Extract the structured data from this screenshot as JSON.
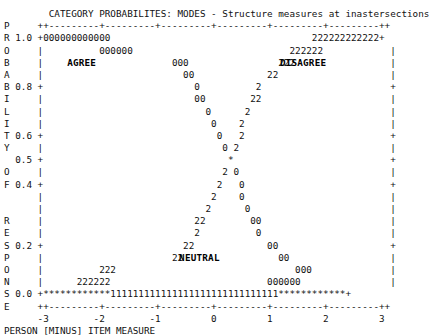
{
  "chart_data": {
    "type": "line",
    "title": "CATEGORY PROBABILITES: MODES - Structure measures at inastersections",
    "xlabel": "PERSON [MINUS] ITEM MEASURE",
    "ylabel": "PROBABILITY OF RESPONSE",
    "xlim": [
      -3,
      3
    ],
    "ylim": [
      0.0,
      1.0
    ],
    "xticklabels": [
      "-3",
      "-2",
      "-1",
      "0",
      "1",
      "2",
      "3"
    ],
    "yticklabels": [
      "1.0",
      "0.8",
      "0.6",
      "0.5",
      "0.4",
      "0.2",
      "0.0"
    ],
    "grid": false,
    "legend_position": "inline-annotations",
    "annotations": [
      {
        "text": "AGREE",
        "x": -2.35,
        "y": 0.93
      },
      {
        "text": "DISAGREE",
        "x": 2.05,
        "y": 0.93
      },
      {
        "text": "NEUTRAL",
        "x": 0.0,
        "y": 0.18
      }
    ],
    "series": [
      {
        "name": "0",
        "symbol": "0",
        "label": "AGREE",
        "x": [
          -3.0,
          -2.9,
          -2.8,
          -2.7,
          -2.6,
          -2.5,
          -2.4,
          -2.3,
          -2.2,
          -2.1,
          -2.0,
          -1.9,
          -1.75,
          -1.6,
          -1.45,
          -1.3,
          -1.15,
          -1.0,
          -0.9,
          -0.8,
          -0.7,
          -0.6,
          -0.5,
          -0.4,
          -0.3,
          -0.2,
          -0.1,
          0.0,
          0.1,
          0.2,
          0.3,
          0.45,
          0.6,
          0.8,
          1.0,
          1.3,
          1.6,
          2.0,
          2.4,
          2.8,
          3.0
        ],
        "y": [
          1.0,
          1.0,
          1.0,
          1.0,
          1.0,
          1.0,
          1.0,
          1.0,
          1.0,
          1.0,
          1.0,
          0.97,
          0.97,
          0.94,
          0.94,
          0.9,
          0.87,
          0.84,
          0.81,
          0.78,
          0.75,
          0.72,
          0.69,
          0.66,
          0.63,
          0.6,
          0.56,
          0.5,
          0.44,
          0.4,
          0.36,
          0.31,
          0.26,
          0.21,
          0.16,
          0.12,
          0.08,
          0.05,
          0.02,
          0.0,
          0.0
        ]
      },
      {
        "name": "1",
        "symbol": "1",
        "label": "NEUTRAL",
        "x": [
          -2.0,
          -1.6,
          -1.2,
          -0.8,
          -0.4,
          0.0,
          0.4,
          0.8,
          1.2,
          1.6,
          2.0
        ],
        "y": [
          0.0,
          0.0,
          0.0,
          0.0,
          0.0,
          0.0,
          0.0,
          0.0,
          0.0,
          0.0,
          0.0
        ]
      },
      {
        "name": "2",
        "symbol": "2",
        "label": "DISAGREE",
        "x": [
          -3.0,
          -2.8,
          -2.4,
          -2.0,
          -1.6,
          -1.3,
          -1.0,
          -0.8,
          -0.6,
          -0.45,
          -0.3,
          -0.2,
          -0.1,
          0.0,
          0.1,
          0.2,
          0.3,
          0.4,
          0.5,
          0.6,
          0.7,
          0.8,
          0.9,
          1.0,
          1.15,
          1.3,
          1.45,
          1.6,
          1.75,
          1.9,
          2.0,
          2.2,
          2.4,
          2.6,
          2.8,
          3.0
        ],
        "y": [
          0.0,
          0.0,
          0.02,
          0.05,
          0.08,
          0.12,
          0.16,
          0.21,
          0.26,
          0.31,
          0.36,
          0.4,
          0.44,
          0.5,
          0.56,
          0.6,
          0.63,
          0.66,
          0.69,
          0.72,
          0.75,
          0.78,
          0.81,
          0.84,
          0.87,
          0.9,
          0.94,
          0.94,
          0.97,
          0.97,
          1.0,
          1.0,
          1.0,
          1.0,
          1.0,
          1.0
        ]
      }
    ]
  },
  "title_line": "        CATEGORY PROBABILITES: MODES - Structure measures at inastersections",
  "rows": [
    {
      "left": "P",
      "tick": "   ",
      "body": "++---------+---------+---------+---------+---------+---------++"
    },
    {
      "left": "R",
      "tick": "1.0",
      "body": "+000000000000                                    222222222222+"
    },
    {
      "left": "O",
      "tick": "   ",
      "body": "|          000000                            222222            |"
    },
    {
      "left": "B",
      "tick": "   ",
      "body": "|                       000                222                 |"
    },
    {
      "left": "A",
      "tick": "   ",
      "body": "|                         00             22                    |"
    },
    {
      "left": "B",
      "tick": "0.8",
      "body": "+                           0          2                       +"
    },
    {
      "left": "I",
      "tick": "   ",
      "body": "|                           00        22                       |"
    },
    {
      "left": "L",
      "tick": "   ",
      "body": "|                             0      2                         |"
    },
    {
      "left": "I",
      "tick": "   ",
      "body": "|                              0    2                          |"
    },
    {
      "left": "T",
      "tick": "0.6",
      "body": "+                               0   2                          +"
    },
    {
      "left": "Y",
      "tick": "   ",
      "body": "|                                0 2                           |"
    },
    {
      "left": " ",
      "tick": "0.5",
      "body": "+                                 *                            +"
    },
    {
      "left": "O",
      "tick": "   ",
      "body": "|                                2 0                           |"
    },
    {
      "left": "F",
      "tick": "0.4",
      "body": "+                               2   0                          +"
    },
    {
      "left": " ",
      "tick": "   ",
      "body": "|                              2    0                          |"
    },
    {
      "left": " ",
      "tick": "   ",
      "body": "|                             2      0                         |"
    },
    {
      "left": "R",
      "tick": "   ",
      "body": "|                           22        00                       |"
    },
    {
      "left": "E",
      "tick": "   ",
      "body": "|                           2          0                       |"
    },
    {
      "left": "S",
      "tick": "0.2",
      "body": "+                         22             00                    +"
    },
    {
      "left": "P",
      "tick": "   ",
      "body": "|                       22                 00                  |"
    },
    {
      "left": "O",
      "tick": "   ",
      "body": "|          222                                000              |"
    },
    {
      "left": "N",
      "tick": "   ",
      "body": "|      222222                            000000                |"
    },
    {
      "left": "S",
      "tick": "0.0",
      "body": "+************111111111111111111111111111111************+"
    },
    {
      "left": "E",
      "tick": "   ",
      "body": "++---------+---------+---------+---------+---------+---------++"
    },
    {
      "left": " ",
      "tick": "   ",
      "body": "-3        -2        -1         0         1         2         3"
    }
  ],
  "footer_line": "PERSON [MINUS] ITEM MEASURE",
  "labels": {
    "agree": "AGREE",
    "disagree": "DISAGREE",
    "neutral": "NEUTRAL"
  },
  "colors": {
    "text": "#111111",
    "background": "#ffffff"
  }
}
